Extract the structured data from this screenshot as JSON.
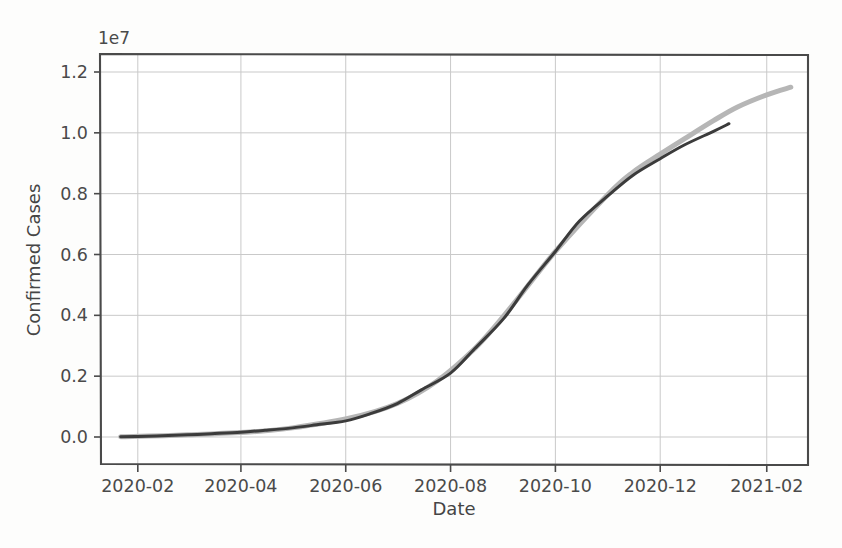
{
  "chart_data": {
    "type": "line",
    "title": "",
    "xlabel": "Date",
    "ylabel": "Confirmed Cases",
    "y_offset_label": "1e7",
    "y_offset_value": 10000000,
    "grid": true,
    "legend_position": "none",
    "xlim": [
      "2020-01-10",
      "2021-02-25"
    ],
    "ylim": [
      0,
      12600000
    ],
    "xticks": [
      "2020-02",
      "2020-04",
      "2020-06",
      "2020-08",
      "2020-10",
      "2020-12",
      "2021-02"
    ],
    "yticks": [
      "0.0",
      "0.2",
      "0.4",
      "0.6",
      "0.8",
      "1.0",
      "1.2"
    ],
    "ytick_values": [
      0,
      2000000,
      4000000,
      6000000,
      8000000,
      10000000,
      12000000
    ],
    "series": [
      {
        "name": "observed",
        "color": "#3b3b3b",
        "linewidth": 3.0,
        "x": [
          "2020-01-22",
          "2020-02-01",
          "2020-02-15",
          "2020-03-01",
          "2020-03-15",
          "2020-04-01",
          "2020-04-15",
          "2020-05-01",
          "2020-05-15",
          "2020-06-01",
          "2020-06-15",
          "2020-07-01",
          "2020-07-15",
          "2020-08-01",
          "2020-08-15",
          "2020-09-01",
          "2020-09-15",
          "2020-10-01",
          "2020-10-15",
          "2020-11-01",
          "2020-11-15",
          "2020-12-01",
          "2020-12-15",
          "2021-01-01",
          "2021-01-10"
        ],
        "values": [
          10000,
          20000,
          40000,
          70000,
          110000,
          160000,
          220000,
          300000,
          400000,
          530000,
          760000,
          1100000,
          1550000,
          2100000,
          2900000,
          3900000,
          5000000,
          6100000,
          7100000,
          7950000,
          8600000,
          9150000,
          9600000,
          10050000,
          10300000
        ]
      },
      {
        "name": "fitted-forecast",
        "color": "#b6b6b6",
        "linewidth": 5.0,
        "x": [
          "2020-01-22",
          "2020-03-01",
          "2020-05-01",
          "2020-07-01",
          "2020-08-15",
          "2020-10-01",
          "2020-11-01",
          "2020-11-15",
          "2020-12-01",
          "2020-12-15",
          "2021-01-01",
          "2021-01-15",
          "2021-02-01",
          "2021-02-15"
        ],
        "values": [
          10000,
          70000,
          300000,
          1100000,
          2900000,
          6100000,
          8000000,
          8700000,
          9300000,
          9800000,
          10400000,
          10850000,
          11250000,
          11500000
        ]
      }
    ]
  }
}
